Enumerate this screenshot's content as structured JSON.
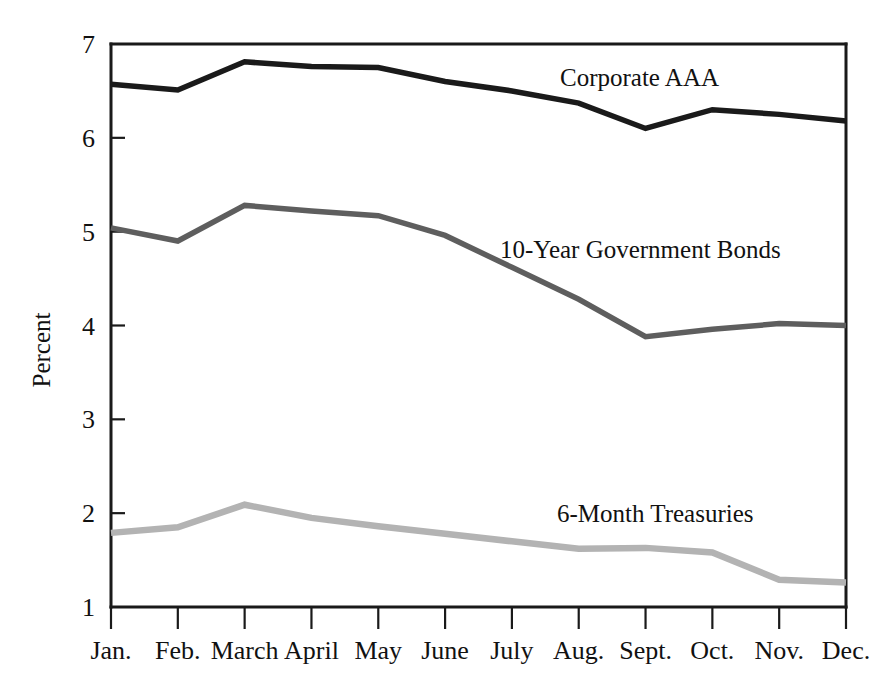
{
  "chart_data": {
    "type": "line",
    "title": "",
    "subtitle": "",
    "xlabel": "",
    "ylabel": "Percent",
    "categories": [
      "Jan.",
      "Feb.",
      "March",
      "April",
      "May",
      "June",
      "July",
      "Aug.",
      "Sept.",
      "Oct.",
      "Nov.",
      "Dec."
    ],
    "xlim": [
      0,
      11
    ],
    "ylim": [
      1,
      7
    ],
    "y_ticks": [
      1,
      2,
      3,
      4,
      5,
      6,
      7
    ],
    "grid": false,
    "legend_position": "inline-annotations",
    "series": [
      {
        "name": "Corporate AAA",
        "color": "#1a1a1a",
        "stroke_width": 5.5,
        "label_x": "June",
        "label_value": 6.63,
        "values": [
          6.57,
          6.51,
          6.81,
          6.76,
          6.75,
          6.6,
          6.5,
          6.37,
          6.1,
          6.3,
          6.25,
          6.18
        ]
      },
      {
        "name": "10-Year Government Bonds",
        "color": "#5e5e5e",
        "stroke_width": 5.5,
        "label_x": "July",
        "label_value": 4.93,
        "values": [
          5.04,
          4.9,
          5.28,
          5.22,
          5.17,
          4.96,
          4.62,
          4.28,
          3.88,
          3.96,
          4.02,
          4.0
        ]
      },
      {
        "name": "6-Month Treasuries",
        "color": "#b3b3b3",
        "stroke_width": 6.5,
        "label_x": "Aug.",
        "label_value": 2.12,
        "values": [
          1.79,
          1.85,
          2.09,
          1.95,
          1.86,
          1.78,
          1.7,
          1.62,
          1.63,
          1.58,
          1.29,
          1.26
        ]
      }
    ]
  },
  "axis_labels": {
    "y": [
      "1",
      "2",
      "3",
      "4",
      "5",
      "6",
      "7"
    ],
    "x": [
      "Jan.",
      "Feb.",
      "March",
      "April",
      "May",
      "June",
      "July",
      "Aug.",
      "Sept.",
      "Oct.",
      "Nov.",
      "Dec."
    ],
    "y_title": "Percent"
  },
  "annotations": [
    {
      "text": "Corporate AAA",
      "x": 560,
      "y": 86
    },
    {
      "text": "10-Year Government Bonds",
      "x": 500,
      "y": 258
    },
    {
      "text": "6-Month Treasuries",
      "x": 557,
      "y": 522
    }
  ]
}
